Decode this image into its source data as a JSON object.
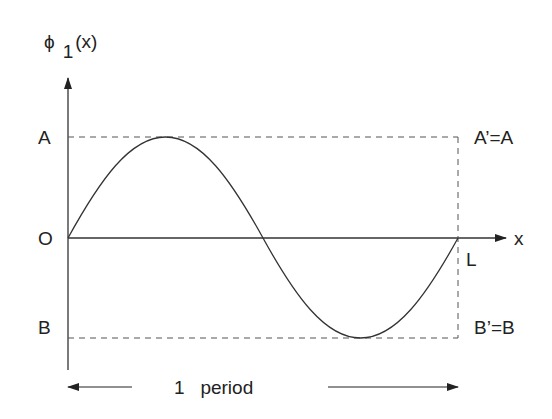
{
  "diagram": {
    "y_axis_label": {
      "symbol": "ϕ",
      "subscript": "1",
      "arg": "(x)"
    },
    "x_axis_label": "x",
    "left_labels": {
      "top": "A",
      "origin": "O",
      "bottom": "B"
    },
    "right_labels": {
      "top": "A’=A",
      "end": "L",
      "bottom": "B’=B"
    },
    "span_label": "1   period",
    "colors": {
      "stroke": "#333333",
      "dash": "#555555"
    }
  }
}
